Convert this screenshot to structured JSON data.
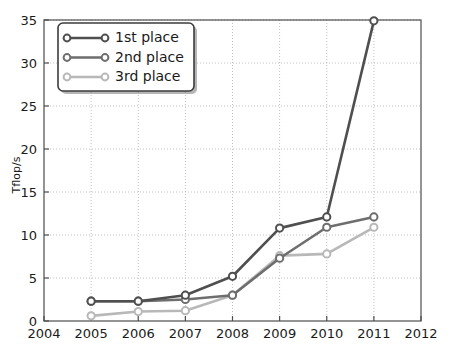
{
  "chart_data": {
    "type": "line",
    "title": "",
    "subtitle": "",
    "xlabel": "",
    "ylabel": "Tflop/s",
    "xlim": [
      2004,
      2012
    ],
    "ylim": [
      0,
      35
    ],
    "grid": true,
    "legend_position": "upper left",
    "x": [
      2005,
      2006,
      2007,
      2008,
      2009,
      2010,
      2011
    ],
    "xticks": [
      "2004",
      "2005",
      "2006",
      "2007",
      "2008",
      "2009",
      "2010",
      "2011",
      "2012"
    ],
    "xtick_values": [
      2004,
      2005,
      2006,
      2007,
      2008,
      2009,
      2010,
      2011,
      2012
    ],
    "yticks": [
      "0",
      "5",
      "10",
      "15",
      "20",
      "25",
      "30",
      "35"
    ],
    "ytick_values": [
      0,
      5,
      10,
      15,
      20,
      25,
      30,
      35
    ],
    "series": [
      {
        "name": "1st place",
        "color": "#4f4f4f",
        "marker": "circle",
        "values": [
          2.3,
          2.3,
          3.0,
          5.2,
          10.8,
          12.1,
          34.9
        ]
      },
      {
        "name": "2nd place",
        "color": "#6e6e6e",
        "marker": "circle",
        "values": [
          2.3,
          2.3,
          2.5,
          3.0,
          7.3,
          10.9,
          12.1
        ]
      },
      {
        "name": "3rd place",
        "color": "#b8b8b8",
        "marker": "circle",
        "values": [
          0.6,
          1.1,
          1.2,
          3.0,
          7.6,
          7.8,
          10.9
        ]
      }
    ]
  },
  "legend": {
    "entries": [
      {
        "label": "1st place"
      },
      {
        "label": "2nd place"
      },
      {
        "label": "3rd place"
      }
    ]
  },
  "axes": {
    "y_title": "Tflop/s"
  }
}
